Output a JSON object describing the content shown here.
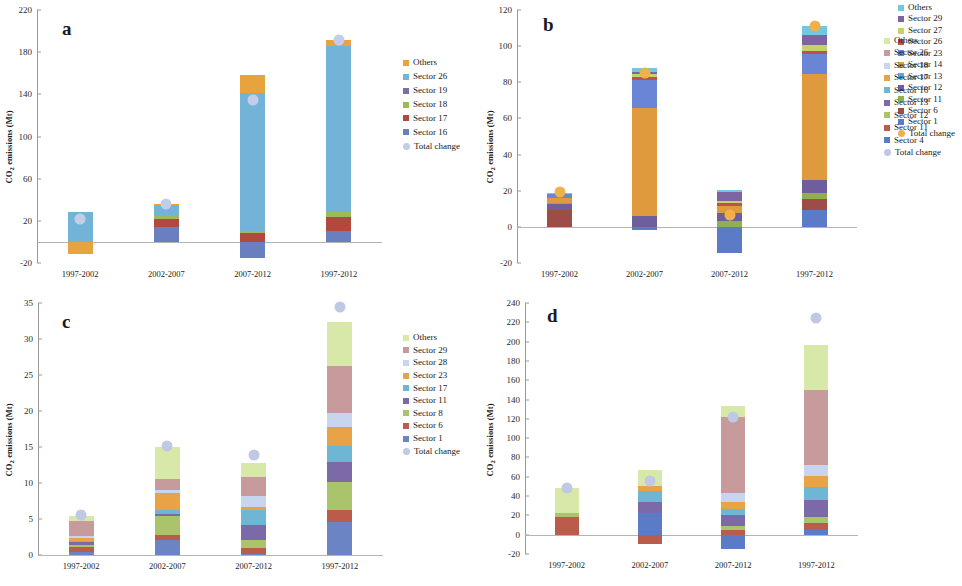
{
  "figure": {
    "panels": [
      "a",
      "b",
      "c",
      "d"
    ],
    "y_axis_title": "CO2 emissions (Mt)",
    "y_axis_title_parts": {
      "pre": "CO",
      "sub": "2",
      "post": " emissions (Mt)"
    },
    "categories": [
      "1997-2002",
      "2002-2007",
      "2007-2012",
      "1997-2012"
    ]
  },
  "chart_data": [
    {
      "type": "bar",
      "panel": "a",
      "title": "a",
      "xlabel": "",
      "ylabel": "CO2 emissions (Mt)",
      "ylim": [
        -20,
        220
      ],
      "yticks": [
        -20,
        20,
        60,
        100,
        140,
        180,
        220
      ],
      "grid": false,
      "legend_position": "right",
      "stacked": true,
      "categories": [
        "1997-2002",
        "2002-2007",
        "2007-2012",
        "1997-2012"
      ],
      "series": [
        {
          "name": "Sector 16",
          "color": "#6A7FC0",
          "values": [
            0.0,
            14.0,
            -15.0,
            10.0
          ]
        },
        {
          "name": "Sector 17",
          "color": "#B3483F",
          "values": [
            0.0,
            8.0,
            8.5,
            14.0
          ]
        },
        {
          "name": "Sector 18",
          "color": "#9BBB59",
          "values": [
            0.0,
            4.0,
            1.5,
            4.0
          ]
        },
        {
          "name": "Sector 19",
          "color": "#7B6FA8",
          "values": [
            0.0,
            0.0,
            0.0,
            0.0
          ]
        },
        {
          "name": "Sector 26",
          "color": "#74B3D8",
          "values": [
            28.0,
            9.0,
            131.0,
            158.0
          ]
        },
        {
          "name": "Others",
          "color": "#E8A33D",
          "values": [
            -11.0,
            1.0,
            17.0,
            6.0
          ]
        }
      ],
      "total_change": {
        "name": "Total change",
        "color": "#C3CDE6",
        "values": [
          22.0,
          36.0,
          135.0,
          192.0
        ]
      }
    },
    {
      "type": "bar",
      "panel": "b",
      "title": "b",
      "xlabel": "",
      "ylabel": "CO2 emissions (Mt)",
      "ylim": [
        -20,
        120
      ],
      "yticks": [
        -20,
        0,
        20,
        40,
        60,
        80,
        100,
        120
      ],
      "grid": false,
      "legend_position": "right",
      "stacked": true,
      "categories": [
        "1997-2002",
        "2002-2007",
        "2007-2012",
        "1997-2012"
      ],
      "series": [
        {
          "name": "Sector 1",
          "color": "#5B7BC6",
          "values": [
            0.0,
            -1.8,
            -14.5,
            9.5
          ]
        },
        {
          "name": "Sector 6",
          "color": "#9E4C46",
          "values": [
            9.5,
            0.0,
            0.0,
            6.0
          ]
        },
        {
          "name": "Sector 11",
          "color": "#8FAF52",
          "values": [
            0.0,
            0.0,
            3.0,
            3.5
          ]
        },
        {
          "name": "Sector 12",
          "color": "#6E5E9B",
          "values": [
            3.0,
            6.0,
            4.5,
            7.0
          ]
        },
        {
          "name": "Sector 13",
          "color": "#62ACCB",
          "values": [
            0.5,
            0.0,
            0.0,
            0.0
          ]
        },
        {
          "name": "Sector 14",
          "color": "#E09A3E",
          "values": [
            3.0,
            59.5,
            4.0,
            58.5
          ]
        },
        {
          "name": "Sector 23",
          "color": "#6A85D6",
          "values": [
            2.0,
            16.0,
            0.0,
            11.0
          ]
        },
        {
          "name": "Sector 26",
          "color": "#C0504D",
          "values": [
            0.0,
            1.5,
            1.5,
            2.0
          ]
        },
        {
          "name": "Sector 27",
          "color": "#C3D26E",
          "values": [
            0.0,
            1.5,
            1.5,
            3.0
          ]
        },
        {
          "name": "Sector 29",
          "color": "#8064A2",
          "values": [
            0.0,
            1.0,
            5.0,
            5.5
          ]
        },
        {
          "name": "Others",
          "color": "#73C7E0",
          "values": [
            1.0,
            2.5,
            1.0,
            5.0
          ]
        }
      ],
      "total_change": {
        "name": "Total change",
        "color": "#F0B04A",
        "values": [
          19.5,
          85.0,
          6.5,
          111.0
        ]
      }
    },
    {
      "type": "bar",
      "panel": "c",
      "title": "c",
      "xlabel": "",
      "ylabel": "CO2 emissions (Mt)",
      "ylim": [
        0,
        35
      ],
      "yticks": [
        0,
        5,
        10,
        15,
        20,
        25,
        30,
        35
      ],
      "grid": false,
      "legend_position": "right",
      "stacked": true,
      "categories": [
        "1997-2002",
        "2002-2007",
        "2007-2012",
        "1997-2012"
      ],
      "series": [
        {
          "name": "Sector 1",
          "color": "#6A84C4",
          "values": [
            0.35,
            2.1,
            0.15,
            4.6
          ]
        },
        {
          "name": "Sector 6",
          "color": "#BB5B4C",
          "values": [
            0.7,
            0.7,
            0.8,
            1.7
          ]
        },
        {
          "name": "Sector 8",
          "color": "#A9C46A",
          "values": [
            0.4,
            2.6,
            1.1,
            3.8
          ]
        },
        {
          "name": "Sector 11",
          "color": "#7C6AA8",
          "values": [
            0.3,
            0.3,
            2.1,
            2.8
          ]
        },
        {
          "name": "Sector 17",
          "color": "#6FB5D4",
          "values": [
            0.25,
            0.5,
            2.1,
            2.2
          ]
        },
        {
          "name": "Sector 23",
          "color": "#E8A348",
          "values": [
            0.3,
            2.4,
            0.45,
            2.7
          ]
        },
        {
          "name": "Sector 28",
          "color": "#C7D6EE",
          "values": [
            0.35,
            0.4,
            1.5,
            1.9
          ]
        },
        {
          "name": "Sector 29",
          "color": "#C79B9B",
          "values": [
            2.1,
            1.6,
            2.6,
            6.6
          ]
        },
        {
          "name": "Others",
          "color": "#D8E8A8",
          "values": [
            0.7,
            4.4,
            2.0,
            6.1
          ]
        }
      ],
      "total_change": {
        "name": "Total change",
        "color": "#BFC9E4",
        "values": [
          5.6,
          15.1,
          13.9,
          34.5
        ]
      }
    },
    {
      "type": "bar",
      "panel": "d",
      "title": "d",
      "xlabel": "",
      "ylabel": "CO2 emissions (Mt)",
      "ylim": [
        -20,
        240
      ],
      "yticks": [
        -20,
        0,
        20,
        40,
        60,
        80,
        100,
        120,
        140,
        160,
        180,
        200,
        220,
        240
      ],
      "grid": false,
      "legend_position": "right",
      "stacked": true,
      "categories": [
        "1997-2002",
        "2002-2007",
        "2007-2012",
        "1997-2012"
      ],
      "series": [
        {
          "name": "Sector 4",
          "color": "#5B7BC6",
          "values": [
            0.0,
            22.0,
            -15.0,
            6.0
          ]
        },
        {
          "name": "Sector 11",
          "color": "#BB5B4C",
          "values": [
            18.0,
            -10.0,
            5.0,
            6.0
          ]
        },
        {
          "name": "Sector 12",
          "color": "#A9C46A",
          "values": [
            4.0,
            0.0,
            4.0,
            6.0
          ]
        },
        {
          "name": "Sector 13",
          "color": "#7C6AA8",
          "values": [
            0.0,
            12.0,
            11.0,
            18.0
          ]
        },
        {
          "name": "Sector 16",
          "color": "#6FB5D4",
          "values": [
            0.0,
            11.0,
            7.0,
            13.0
          ]
        },
        {
          "name": "Sector 17",
          "color": "#E8A348",
          "values": [
            0.0,
            5.0,
            7.0,
            12.0
          ]
        },
        {
          "name": "Sector 18",
          "color": "#C7D6EE",
          "values": [
            0.0,
            0.0,
            9.0,
            11.0
          ]
        },
        {
          "name": "Sector 26",
          "color": "#C79B9B",
          "values": [
            0.0,
            0.0,
            79.0,
            78.0
          ]
        },
        {
          "name": "Others",
          "color": "#D8E8A8",
          "values": [
            26.0,
            17.0,
            11.0,
            47.0
          ]
        }
      ],
      "total_change": {
        "name": "Total change",
        "color": "#BFC9E4",
        "values": [
          48.0,
          56.0,
          122.0,
          224.0
        ]
      }
    }
  ]
}
